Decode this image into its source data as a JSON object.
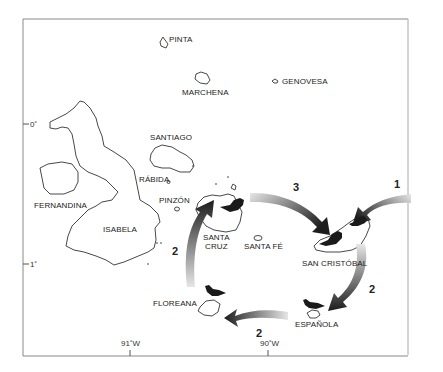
{
  "map": {
    "region": "Galápagos Islands",
    "frame_color": "#888888",
    "island_outline_color": "#333333",
    "bird_color": "#1a1a1a",
    "islands": [
      {
        "name": "PINTA"
      },
      {
        "name": "MARCHENA"
      },
      {
        "name": "GENOVESA"
      },
      {
        "name": "SANTIAGO"
      },
      {
        "name": "RÁBIDA"
      },
      {
        "name": "FERNANDINA"
      },
      {
        "name": "ISABELA"
      },
      {
        "name": "PINZÓN"
      },
      {
        "name": "SANTA CRUZ",
        "line1": "SANTA",
        "line2": "CRUZ"
      },
      {
        "name": "SANTA FÉ"
      },
      {
        "name": "SAN CRISTÓBAL"
      },
      {
        "name": "ESPAÑOLA"
      },
      {
        "name": "FLOREANA"
      }
    ],
    "latitude_ticks": [
      "0˚",
      "1˚"
    ],
    "longitude_ticks": [
      "91˚W",
      "90˚W"
    ],
    "arrows": [
      {
        "label": "1",
        "from": "outside (east)",
        "to": "SAN CRISTÓBAL"
      },
      {
        "label": "2",
        "from": "SAN CRISTÓBAL",
        "to": "ESPAÑOLA"
      },
      {
        "label": "2",
        "from": "ESPAÑOLA",
        "to": "FLOREANA"
      },
      {
        "label": "2",
        "from": "FLOREANA",
        "to": "SANTA CRUZ"
      },
      {
        "label": "3",
        "from": "SANTA CRUZ",
        "to": "SAN CRISTÓBAL"
      }
    ],
    "birds": [
      "SANTA CRUZ",
      "SAN CRISTÓBAL",
      "SAN CRISTÓBAL",
      "ESPAÑOLA",
      "FLOREANA"
    ]
  }
}
